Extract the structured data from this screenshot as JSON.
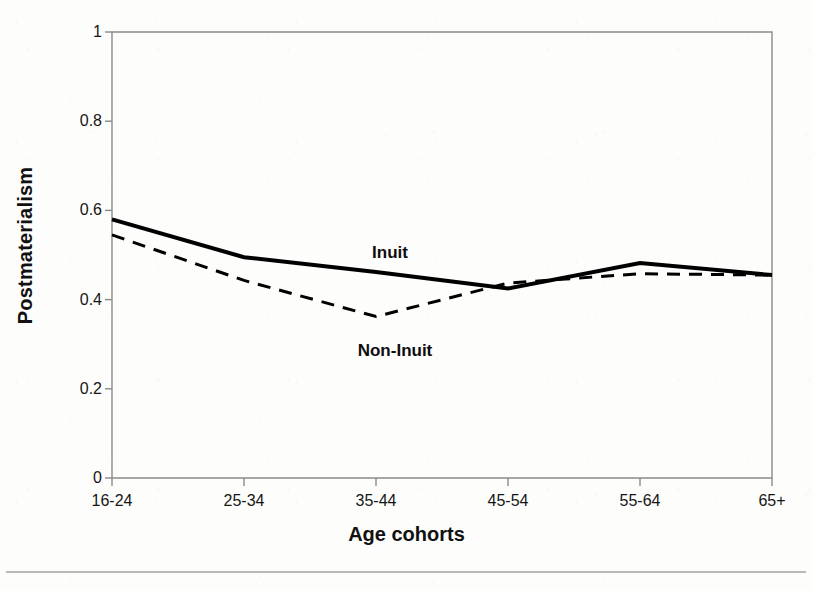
{
  "chart_data": {
    "type": "line",
    "title": "",
    "xlabel": "Age cohorts",
    "ylabel": "Postmaterialism",
    "categories": [
      "16-24",
      "25-34",
      "35-44",
      "45-54",
      "55-64",
      "65+"
    ],
    "ylim": [
      0,
      1
    ],
    "yticks": [
      "0",
      "0.2",
      "0.4",
      "0.6",
      "0.8",
      "1"
    ],
    "ytick_values": [
      0,
      0.2,
      0.4,
      0.6,
      0.8,
      1
    ],
    "grid": false,
    "legend_position": "inline-annotations",
    "series": [
      {
        "name": "Inuit",
        "style": "solid",
        "color": "#000000",
        "line_width": 4,
        "values": [
          0.58,
          0.495,
          0.462,
          0.425,
          0.482,
          0.455
        ],
        "label_x_category": "35-44",
        "label_offset": "above"
      },
      {
        "name": "Non-Inuit",
        "style": "dashed",
        "color": "#000000",
        "line_width": 3,
        "values": [
          0.545,
          0.443,
          0.362,
          0.437,
          0.458,
          0.455
        ],
        "label_x_category": "35-44",
        "label_offset": "below"
      }
    ],
    "annotations": [
      {
        "text": "Inuit",
        "x_px": 390,
        "y_px": 243
      },
      {
        "text": "Non-Inuit",
        "x_px": 395,
        "y_px": 341
      }
    ]
  },
  "axes": {
    "plot_left_px": 112,
    "plot_right_px": 772,
    "plot_top_px": 32,
    "plot_bottom_px": 478
  },
  "figure": {
    "background_color": "#fdfdfc",
    "axis_color": "#808080",
    "ink_color": "#000000"
  }
}
